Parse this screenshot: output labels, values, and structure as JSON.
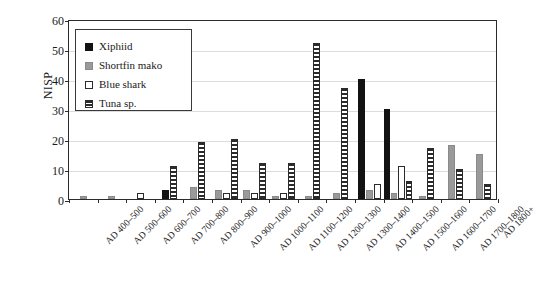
{
  "chart_data": {
    "type": "bar",
    "title": "",
    "xlabel": "",
    "ylabel": "NISP",
    "ylim": [
      0,
      60
    ],
    "yticks": [
      0,
      10,
      20,
      30,
      40,
      50,
      60
    ],
    "grid": true,
    "legend_position": "top-left-inside",
    "categories": [
      "AD 400–500",
      "AD 500–600",
      "AD 600–700",
      "AD 700–800",
      "AD 800–900",
      "AD 900–1000",
      "AD 1000–1100",
      "AD 1100–1200",
      "AD 1200–1300",
      "AD 1300–1400",
      "AD 1400–1500",
      "AD 1500–1600",
      "AD 1600–1700",
      "AD 1700–1800",
      "AD 1800+"
    ],
    "series": [
      {
        "name": "Xiphiid",
        "color": "#121212",
        "values": [
          0,
          0,
          0,
          3,
          0,
          0,
          0,
          0,
          0,
          0,
          40,
          30,
          0,
          0,
          0
        ]
      },
      {
        "name": "Shortfin mako",
        "color": "#9a9a9a",
        "values": [
          1,
          1,
          0,
          0,
          4,
          3,
          3,
          1,
          1,
          2,
          3,
          2,
          1,
          18,
          15
        ]
      },
      {
        "name": "Blue shark",
        "color": "#ffffff",
        "values": [
          0,
          0,
          2,
          0,
          0,
          2,
          2,
          2,
          0,
          0,
          5,
          11,
          0,
          0,
          0
        ]
      },
      {
        "name": "Tuna sp.",
        "color": "#2b2b2b",
        "values": [
          0,
          0,
          0,
          11,
          19,
          20,
          12,
          12,
          52,
          37,
          0,
          6,
          17,
          10,
          5
        ]
      }
    ]
  },
  "legend": {
    "items": [
      {
        "label": "Xiphiid",
        "swatch": "xiphiid"
      },
      {
        "label": "Shortfin mako",
        "swatch": "mako"
      },
      {
        "label": "Blue shark",
        "swatch": "blue"
      },
      {
        "label": "Tuna sp.",
        "swatch": "tuna"
      }
    ]
  }
}
